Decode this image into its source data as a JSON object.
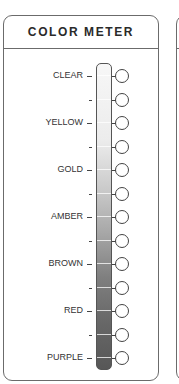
{
  "title": "COLOR METER",
  "scale": {
    "gradient_top": "#f7f7f7",
    "gradient_bottom": "#575757",
    "rows": [
      {
        "label": "CLEAR",
        "major": true
      },
      {
        "label": "",
        "major": false
      },
      {
        "label": "YELLOW",
        "major": true
      },
      {
        "label": "",
        "major": false
      },
      {
        "label": "GOLD",
        "major": true
      },
      {
        "label": "",
        "major": false
      },
      {
        "label": "AMBER",
        "major": true
      },
      {
        "label": "",
        "major": false
      },
      {
        "label": "BROWN",
        "major": true
      },
      {
        "label": "",
        "major": false
      },
      {
        "label": "RED",
        "major": true
      },
      {
        "label": "",
        "major": false
      },
      {
        "label": "PURPLE",
        "major": true
      }
    ]
  }
}
